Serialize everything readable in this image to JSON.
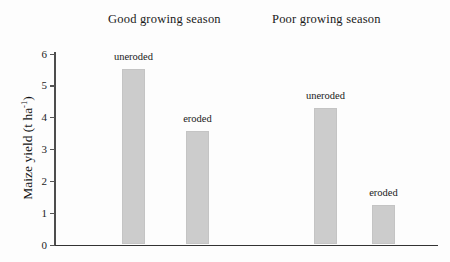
{
  "figure": {
    "background_color": "#fdfdfd",
    "bar_color": "#cccccc",
    "axis_color": "#4d4d4d"
  },
  "groups": [
    {
      "title": "Good growing season"
    },
    {
      "title": "Poor growing season"
    }
  ],
  "y_axis": {
    "title_main": "Maize yield (t ha",
    "title_sup": "-1",
    "title_close": ")",
    "ticks": [
      "0",
      "1",
      "2",
      "3",
      "4",
      "5",
      "6"
    ]
  },
  "bar_labels": {
    "b0": "uneroded",
    "b1": "eroded",
    "b2": "uneroded",
    "b3": "eroded"
  },
  "chart_data": {
    "type": "bar",
    "title": "",
    "xlabel": "",
    "ylabel": "Maize yield (t ha-1)",
    "ylim": [
      0,
      6
    ],
    "yticks": [
      0,
      1,
      2,
      3,
      4,
      5,
      6
    ],
    "grid": false,
    "legend_position": "none",
    "groups": [
      "Good growing season",
      "Poor growing season"
    ],
    "categories": [
      "uneroded",
      "eroded",
      "uneroded",
      "eroded"
    ],
    "values": [
      5.5,
      3.55,
      4.3,
      1.25
    ],
    "bars": [
      {
        "group": "Good growing season",
        "category": "uneroded",
        "value": 5.5
      },
      {
        "group": "Good growing season",
        "category": "eroded",
        "value": 3.55
      },
      {
        "group": "Poor growing season",
        "category": "uneroded",
        "value": 4.3
      },
      {
        "group": "Poor growing season",
        "category": "eroded",
        "value": 1.25
      }
    ],
    "annotations": [
      "uneroded",
      "eroded",
      "uneroded",
      "eroded"
    ]
  }
}
